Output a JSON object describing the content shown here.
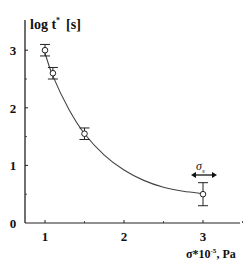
{
  "chart_data": {
    "type": "scatter",
    "title": "",
    "xlabel": "σ*10⁻⁵, Pa",
    "ylabel": "log t* [s]",
    "xlim": [
      0.75,
      3.5
    ],
    "ylim": [
      0,
      3.3
    ],
    "x_ticks": [
      1,
      2,
      3
    ],
    "y_ticks": [
      0,
      1,
      2,
      3
    ],
    "grid": false,
    "legend": null,
    "series": [
      {
        "name": "measured",
        "marker": "open-circle",
        "x": [
          1.0,
          1.1,
          1.5,
          3.0
        ],
        "y": [
          3.0,
          2.6,
          1.55,
          0.5
        ],
        "yerr": [
          0.1,
          0.1,
          0.1,
          0.2
        ]
      },
      {
        "name": "fit",
        "style": "line",
        "x": [
          1.0,
          1.1,
          1.3,
          1.5,
          1.75,
          2.0,
          2.25,
          2.5,
          2.75,
          3.0
        ],
        "y": [
          2.95,
          2.55,
          1.98,
          1.55,
          1.18,
          0.92,
          0.74,
          0.62,
          0.55,
          0.51
        ]
      }
    ],
    "annotations": [
      {
        "text": "σ",
        "subscript": "s",
        "x": 3.0,
        "y": 0.95,
        "arrow": "double-horizontal"
      }
    ]
  },
  "axes": {
    "y_label_main": "log t",
    "y_label_sup": "*",
    "y_label_unit": "[s]",
    "x_label_main": "σ*10",
    "x_label_sup": "-5",
    "x_label_unit": ", Pa",
    "annotation_main": "σ",
    "annotation_sub": "s"
  },
  "colors": {
    "line": "#444444",
    "axis": "#222222",
    "text": "#111111",
    "marker_fill": "#ffffff"
  }
}
